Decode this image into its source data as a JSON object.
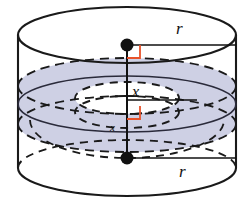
{
  "figure": {
    "type": "geometry-diagram",
    "canvas": {
      "width": 247,
      "height": 206,
      "background": "#ffffff"
    },
    "colors": {
      "outline": "#1a1a1a",
      "hidden_dash": "#1a1a1a",
      "shade_fill": "#ced0e4",
      "shade_stroke": "#2a2a3a",
      "right_angle_marker": "#e8522a",
      "dot": "#111111",
      "label_text": "#111111"
    },
    "cylinder": {
      "left_x": 18,
      "right_x": 237,
      "center_x": 127,
      "top_ellipse_cy": 35,
      "bottom_ellipse_cy": 168,
      "rx": 109,
      "ry": 28
    },
    "torus": {
      "mid_ellipse_cy": 104,
      "outer_rx": 109,
      "outer_ry": 28,
      "inner_rx": 52,
      "inner_ry": 14,
      "tube_top_cy": 86,
      "tube_bottom_cy": 124
    }
  },
  "labels": {
    "radius_top": {
      "text": "r",
      "x": 176,
      "y": 20
    },
    "radius_bottom": {
      "text": "r",
      "x": 179,
      "y": 163
    },
    "x_mid": {
      "text": "x",
      "x": 132,
      "y": 84
    },
    "x_low": {
      "text": "x",
      "x": 110,
      "y": 122
    }
  },
  "markers": {
    "top_dot": {
      "cx": 127,
      "cy": 45,
      "r": 6.5
    },
    "bottom_dot": {
      "cx": 127,
      "cy": 158,
      "r": 6.5
    },
    "right_angle_upper": {
      "x": 127,
      "y": 45,
      "size": 13
    },
    "right_angle_lower": {
      "x": 127,
      "y": 118,
      "size": 12
    }
  },
  "segments": {
    "radius_top_line": {
      "x1": 127,
      "y1": 45,
      "x2": 237,
      "y2": 45
    },
    "radius_bottom_line": {
      "x1": 127,
      "y1": 158,
      "x2": 237,
      "y2": 158
    },
    "x_mid_line": {
      "x1": 127,
      "y1": 100,
      "x2": 197,
      "y2": 100
    },
    "vertical_axis": {
      "x1": 127,
      "y1": 45,
      "x2": 127,
      "y2": 158
    }
  }
}
